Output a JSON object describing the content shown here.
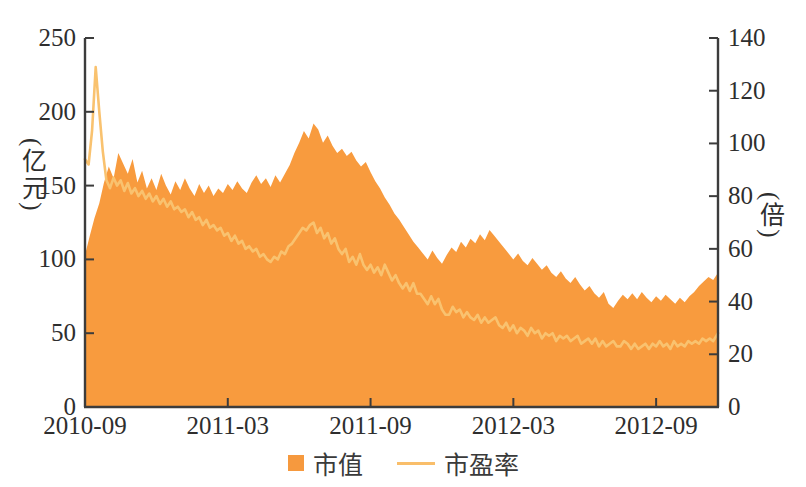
{
  "chart_data": {
    "type": "area+line",
    "title": "",
    "x_axis": {
      "tick_labels": [
        "2010-09",
        "2011-03",
        "2011-09",
        "2012-03",
        "2012-09"
      ],
      "tick_months": [
        0,
        6,
        12,
        18,
        24
      ],
      "range_months": [
        0,
        26.6
      ],
      "unit": "months since 2010-09"
    },
    "left_axis": {
      "label": "(亿元)",
      "ticks": [
        0,
        50,
        100,
        150,
        200,
        250
      ],
      "range": [
        0,
        250
      ],
      "series": "市值"
    },
    "right_axis": {
      "label": "(倍)",
      "ticks": [
        0,
        20,
        40,
        60,
        80,
        100,
        120,
        140
      ],
      "range": [
        0,
        140
      ],
      "series": "市盈率"
    },
    "grid": false,
    "legend_position": "bottom-center",
    "legend": [
      {
        "label": "市值",
        "type": "area",
        "color": "#F6993E"
      },
      {
        "label": "市盈率",
        "type": "line",
        "color": "#F9BE6A"
      }
    ],
    "series": [
      {
        "name": "市值",
        "type": "area",
        "axis": "left",
        "unit": "亿元",
        "color": "#F89B3E",
        "points": [
          [
            0,
            103
          ],
          [
            0.2,
            116
          ],
          [
            0.4,
            128
          ],
          [
            0.6,
            138
          ],
          [
            0.8,
            152
          ],
          [
            1.0,
            163
          ],
          [
            1.2,
            155
          ],
          [
            1.4,
            172
          ],
          [
            1.6,
            165
          ],
          [
            1.8,
            158
          ],
          [
            2.0,
            168
          ],
          [
            2.2,
            152
          ],
          [
            2.4,
            160
          ],
          [
            2.6,
            148
          ],
          [
            2.8,
            155
          ],
          [
            3.0,
            147
          ],
          [
            3.2,
            158
          ],
          [
            3.4,
            150
          ],
          [
            3.6,
            144
          ],
          [
            3.8,
            153
          ],
          [
            4.0,
            147
          ],
          [
            4.2,
            155
          ],
          [
            4.4,
            148
          ],
          [
            4.6,
            143
          ],
          [
            4.8,
            151
          ],
          [
            5.0,
            145
          ],
          [
            5.2,
            150
          ],
          [
            5.4,
            143
          ],
          [
            5.6,
            148
          ],
          [
            5.8,
            145
          ],
          [
            6.0,
            151
          ],
          [
            6.2,
            147
          ],
          [
            6.4,
            153
          ],
          [
            6.6,
            148
          ],
          [
            6.8,
            145
          ],
          [
            7.0,
            152
          ],
          [
            7.2,
            157
          ],
          [
            7.4,
            151
          ],
          [
            7.6,
            155
          ],
          [
            7.8,
            149
          ],
          [
            8.0,
            157
          ],
          [
            8.2,
            152
          ],
          [
            8.4,
            158
          ],
          [
            8.6,
            164
          ],
          [
            8.8,
            172
          ],
          [
            9.0,
            179
          ],
          [
            9.2,
            187
          ],
          [
            9.4,
            182
          ],
          [
            9.6,
            192
          ],
          [
            9.8,
            188
          ],
          [
            10.0,
            179
          ],
          [
            10.2,
            184
          ],
          [
            10.4,
            177
          ],
          [
            10.6,
            172
          ],
          [
            10.8,
            175
          ],
          [
            11.0,
            170
          ],
          [
            11.2,
            173
          ],
          [
            11.4,
            167
          ],
          [
            11.6,
            163
          ],
          [
            11.8,
            166
          ],
          [
            12.0,
            159
          ],
          [
            12.2,
            153
          ],
          [
            12.4,
            148
          ],
          [
            12.6,
            142
          ],
          [
            12.8,
            137
          ],
          [
            13.0,
            131
          ],
          [
            13.2,
            127
          ],
          [
            13.4,
            122
          ],
          [
            13.6,
            117
          ],
          [
            13.8,
            112
          ],
          [
            14.0,
            108
          ],
          [
            14.2,
            104
          ],
          [
            14.4,
            100
          ],
          [
            14.6,
            106
          ],
          [
            14.8,
            101
          ],
          [
            15.0,
            97
          ],
          [
            15.2,
            103
          ],
          [
            15.4,
            108
          ],
          [
            15.6,
            105
          ],
          [
            15.8,
            112
          ],
          [
            16.0,
            108
          ],
          [
            16.2,
            114
          ],
          [
            16.4,
            111
          ],
          [
            16.6,
            117
          ],
          [
            16.8,
            113
          ],
          [
            17.0,
            120
          ],
          [
            17.2,
            116
          ],
          [
            17.4,
            112
          ],
          [
            17.6,
            108
          ],
          [
            17.8,
            104
          ],
          [
            18.0,
            100
          ],
          [
            18.2,
            104
          ],
          [
            18.4,
            99
          ],
          [
            18.6,
            96
          ],
          [
            18.8,
            101
          ],
          [
            19.0,
            97
          ],
          [
            19.2,
            93
          ],
          [
            19.4,
            96
          ],
          [
            19.6,
            91
          ],
          [
            19.8,
            88
          ],
          [
            20.0,
            92
          ],
          [
            20.2,
            87
          ],
          [
            20.4,
            84
          ],
          [
            20.6,
            88
          ],
          [
            20.8,
            83
          ],
          [
            21.0,
            79
          ],
          [
            21.2,
            82
          ],
          [
            21.4,
            77
          ],
          [
            21.6,
            74
          ],
          [
            21.8,
            78
          ],
          [
            22.0,
            70
          ],
          [
            22.2,
            67
          ],
          [
            22.4,
            72
          ],
          [
            22.6,
            76
          ],
          [
            22.8,
            73
          ],
          [
            23.0,
            77
          ],
          [
            23.2,
            73
          ],
          [
            23.4,
            78
          ],
          [
            23.6,
            74
          ],
          [
            23.8,
            71
          ],
          [
            24.0,
            75
          ],
          [
            24.2,
            72
          ],
          [
            24.4,
            76
          ],
          [
            24.6,
            73
          ],
          [
            24.8,
            70
          ],
          [
            25.0,
            74
          ],
          [
            25.2,
            71
          ],
          [
            25.4,
            75
          ],
          [
            25.6,
            78
          ],
          [
            25.8,
            82
          ],
          [
            26.0,
            85
          ],
          [
            26.2,
            88
          ],
          [
            26.4,
            86
          ],
          [
            26.6,
            91
          ]
        ]
      },
      {
        "name": "市盈率",
        "type": "line",
        "axis": "right",
        "unit": "倍",
        "color": "#F9C26F",
        "points": [
          [
            0,
            94
          ],
          [
            0.15,
            92
          ],
          [
            0.3,
            105
          ],
          [
            0.45,
            129
          ],
          [
            0.6,
            112
          ],
          [
            0.75,
            97
          ],
          [
            0.9,
            86
          ],
          [
            1.05,
            83
          ],
          [
            1.2,
            87
          ],
          [
            1.35,
            84
          ],
          [
            1.5,
            86
          ],
          [
            1.65,
            82
          ],
          [
            1.8,
            85
          ],
          [
            1.95,
            81
          ],
          [
            2.1,
            83
          ],
          [
            2.25,
            80
          ],
          [
            2.4,
            82
          ],
          [
            2.55,
            79
          ],
          [
            2.7,
            81
          ],
          [
            2.85,
            78
          ],
          [
            3.0,
            80
          ],
          [
            3.15,
            77
          ],
          [
            3.3,
            79
          ],
          [
            3.45,
            76
          ],
          [
            3.6,
            78
          ],
          [
            3.75,
            75
          ],
          [
            3.9,
            76
          ],
          [
            4.05,
            74
          ],
          [
            4.2,
            75
          ],
          [
            4.35,
            72
          ],
          [
            4.5,
            74
          ],
          [
            4.65,
            71
          ],
          [
            4.8,
            72
          ],
          [
            4.95,
            69
          ],
          [
            5.1,
            71
          ],
          [
            5.25,
            68
          ],
          [
            5.4,
            69
          ],
          [
            5.55,
            67
          ],
          [
            5.7,
            68
          ],
          [
            5.85,
            65
          ],
          [
            6.0,
            66
          ],
          [
            6.15,
            63
          ],
          [
            6.3,
            65
          ],
          [
            6.45,
            62
          ],
          [
            6.6,
            63
          ],
          [
            6.75,
            60
          ],
          [
            6.9,
            61
          ],
          [
            7.05,
            59
          ],
          [
            7.2,
            60
          ],
          [
            7.35,
            57
          ],
          [
            7.5,
            58
          ],
          [
            7.65,
            56
          ],
          [
            7.8,
            55
          ],
          [
            7.95,
            57
          ],
          [
            8.1,
            56
          ],
          [
            8.25,
            59
          ],
          [
            8.4,
            58
          ],
          [
            8.55,
            61
          ],
          [
            8.7,
            62
          ],
          [
            8.85,
            64
          ],
          [
            9.0,
            66
          ],
          [
            9.15,
            68
          ],
          [
            9.3,
            67
          ],
          [
            9.45,
            69
          ],
          [
            9.6,
            70
          ],
          [
            9.75,
            66
          ],
          [
            9.9,
            68
          ],
          [
            10.05,
            64
          ],
          [
            10.2,
            66
          ],
          [
            10.35,
            62
          ],
          [
            10.5,
            64
          ],
          [
            10.65,
            60
          ],
          [
            10.8,
            58
          ],
          [
            10.95,
            60
          ],
          [
            11.1,
            55
          ],
          [
            11.25,
            57
          ],
          [
            11.4,
            54
          ],
          [
            11.55,
            58
          ],
          [
            11.7,
            54
          ],
          [
            11.85,
            52
          ],
          [
            12.0,
            54
          ],
          [
            12.15,
            51
          ],
          [
            12.3,
            53
          ],
          [
            12.45,
            50
          ],
          [
            12.6,
            54
          ],
          [
            12.75,
            51
          ],
          [
            12.9,
            48
          ],
          [
            13.05,
            50
          ],
          [
            13.2,
            47
          ],
          [
            13.35,
            45
          ],
          [
            13.5,
            47
          ],
          [
            13.65,
            44
          ],
          [
            13.8,
            47
          ],
          [
            13.95,
            43
          ],
          [
            14.1,
            43
          ],
          [
            14.25,
            41
          ],
          [
            14.4,
            39
          ],
          [
            14.55,
            42
          ],
          [
            14.7,
            39
          ],
          [
            14.85,
            41
          ],
          [
            15.0,
            37
          ],
          [
            15.15,
            35
          ],
          [
            15.3,
            35
          ],
          [
            15.45,
            38
          ],
          [
            15.6,
            36
          ],
          [
            15.75,
            37
          ],
          [
            15.9,
            34
          ],
          [
            16.05,
            36
          ],
          [
            16.2,
            34
          ],
          [
            16.35,
            33
          ],
          [
            16.5,
            35
          ],
          [
            16.65,
            32
          ],
          [
            16.8,
            34
          ],
          [
            16.95,
            32
          ],
          [
            17.1,
            33
          ],
          [
            17.25,
            34
          ],
          [
            17.4,
            31
          ],
          [
            17.55,
            30
          ],
          [
            17.7,
            32
          ],
          [
            17.85,
            29
          ],
          [
            18.0,
            31
          ],
          [
            18.15,
            28
          ],
          [
            18.3,
            30
          ],
          [
            18.45,
            29
          ],
          [
            18.6,
            27
          ],
          [
            18.75,
            30
          ],
          [
            18.9,
            28
          ],
          [
            19.05,
            29
          ],
          [
            19.2,
            26
          ],
          [
            19.35,
            28
          ],
          [
            19.5,
            27
          ],
          [
            19.65,
            28
          ],
          [
            19.8,
            25
          ],
          [
            19.95,
            27
          ],
          [
            20.1,
            26
          ],
          [
            20.25,
            27
          ],
          [
            20.4,
            25
          ],
          [
            20.55,
            26
          ],
          [
            20.7,
            27
          ],
          [
            20.85,
            24
          ],
          [
            21.0,
            25
          ],
          [
            21.15,
            26
          ],
          [
            21.3,
            24
          ],
          [
            21.45,
            26
          ],
          [
            21.6,
            23
          ],
          [
            21.75,
            25
          ],
          [
            21.9,
            23
          ],
          [
            22.05,
            24
          ],
          [
            22.2,
            25
          ],
          [
            22.35,
            23
          ],
          [
            22.5,
            23
          ],
          [
            22.65,
            25
          ],
          [
            22.8,
            24
          ],
          [
            22.95,
            22
          ],
          [
            23.1,
            24
          ],
          [
            23.25,
            22
          ],
          [
            23.4,
            23
          ],
          [
            23.55,
            24
          ],
          [
            23.7,
            22
          ],
          [
            23.85,
            24
          ],
          [
            24.0,
            23
          ],
          [
            24.15,
            25
          ],
          [
            24.3,
            23
          ],
          [
            24.45,
            24
          ],
          [
            24.6,
            22
          ],
          [
            24.75,
            25
          ],
          [
            24.9,
            23
          ],
          [
            25.05,
            24
          ],
          [
            25.2,
            23
          ],
          [
            25.35,
            25
          ],
          [
            25.5,
            24
          ],
          [
            25.65,
            25
          ],
          [
            25.8,
            24
          ],
          [
            25.95,
            26
          ],
          [
            26.1,
            25
          ],
          [
            26.25,
            26
          ],
          [
            26.4,
            25
          ],
          [
            26.6,
            28
          ]
        ]
      }
    ]
  },
  "colors": {
    "background": "#ffffff",
    "axis": "#3c3c3c",
    "tick_text": "#2e2e2e",
    "area_fill": "#F89B3E",
    "line_stroke": "#F9C26F"
  },
  "plot": {
    "left_px": 85,
    "right_px": 718,
    "top_px": 38,
    "bottom_px": 407,
    "tick_len": 9,
    "tick_font_px": 25,
    "x_label_baseline_px": 434
  }
}
